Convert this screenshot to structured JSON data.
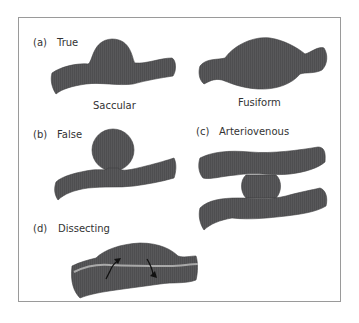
{
  "figure": {
    "colors": {
      "vessel": "#58585a",
      "stroke": "#3a3a3c",
      "intima_line": "#a9a9a9",
      "frame": "#9a9a9a"
    },
    "panels": [
      {
        "id": "a",
        "letter": "(a)",
        "title": "True",
        "sublabels": [
          "Saccular",
          "Fusiform"
        ]
      },
      {
        "id": "b",
        "letter": "(b)",
        "title": "False"
      },
      {
        "id": "c",
        "letter": "(c)",
        "title": "Arteriovenous"
      },
      {
        "id": "d",
        "letter": "(d)",
        "title": "Dissecting"
      }
    ]
  }
}
